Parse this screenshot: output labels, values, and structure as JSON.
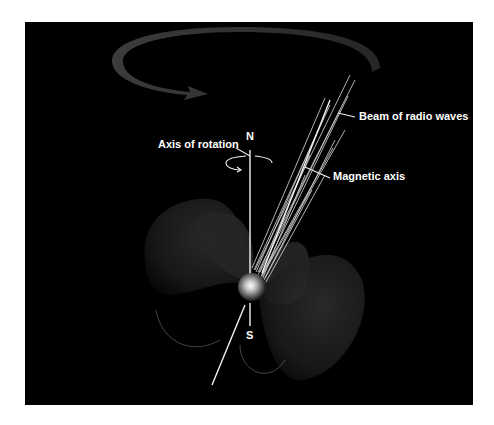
{
  "diagram": {
    "colors": {
      "background": "#000000",
      "page": "#ffffff",
      "label_text": "#ffffff",
      "lines": "#f2f2f2",
      "rotation_arrow": "#3a3a3a",
      "field_lobes": "#2a2a2a",
      "star_core": "#ffffff"
    },
    "labels": {
      "beam": "Beam of radio waves",
      "magnetic_axis": "Magnetic axis",
      "rotation_axis": "Axis of rotation",
      "north": "N",
      "south": "S"
    },
    "components": [
      {
        "name": "neutron-star",
        "center": [
          252,
          287
        ],
        "radius": 14
      },
      {
        "name": "axis-of-rotation",
        "from": [
          250,
          150
        ],
        "to": [
          250,
          326
        ]
      },
      {
        "name": "magnetic-axis",
        "from": [
          212,
          385
        ],
        "to": [
          328,
          100
        ]
      },
      {
        "name": "beam-of-radio-waves",
        "direction": "along magnetic axis, upper right"
      },
      {
        "name": "rotation-arrow",
        "direction": "counter-clockwise (viewed from above)"
      },
      {
        "name": "magnetic-field-lobes",
        "count": 4
      }
    ]
  }
}
